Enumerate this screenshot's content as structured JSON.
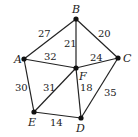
{
  "graph": {
    "nodes": [
      {
        "id": "A",
        "label": "A",
        "x": 24,
        "y": 59,
        "lx": 14,
        "ly": 63
      },
      {
        "id": "B",
        "label": "B",
        "x": 76,
        "y": 19,
        "lx": 72,
        "ly": 13
      },
      {
        "id": "C",
        "label": "C",
        "x": 118,
        "y": 58,
        "lx": 123,
        "ly": 62
      },
      {
        "id": "D",
        "label": "D",
        "x": 81,
        "y": 118,
        "lx": 76,
        "ly": 132
      },
      {
        "id": "E",
        "label": "E",
        "x": 34,
        "y": 112,
        "lx": 28,
        "ly": 126
      },
      {
        "id": "F",
        "label": "F",
        "x": 76,
        "y": 68,
        "lx": 79,
        "ly": 80
      }
    ],
    "edges": [
      {
        "from": "A",
        "to": "B",
        "weight": "27",
        "lx": 38,
        "ly": 37
      },
      {
        "from": "B",
        "to": "C",
        "weight": "20",
        "lx": 98,
        "ly": 37
      },
      {
        "from": "B",
        "to": "F",
        "weight": "21",
        "lx": 64,
        "ly": 47
      },
      {
        "from": "A",
        "to": "F",
        "weight": "32",
        "lx": 44,
        "ly": 60
      },
      {
        "from": "F",
        "to": "C",
        "weight": "24",
        "lx": 90,
        "ly": 61
      },
      {
        "from": "A",
        "to": "E",
        "weight": "30",
        "lx": 15,
        "ly": 91
      },
      {
        "from": "E",
        "to": "F",
        "weight": "31",
        "lx": 43,
        "ly": 91
      },
      {
        "from": "F",
        "to": "D",
        "weight": "18",
        "lx": 80,
        "ly": 91
      },
      {
        "from": "C",
        "to": "D",
        "weight": "35",
        "lx": 104,
        "ly": 96
      },
      {
        "from": "E",
        "to": "D",
        "weight": "14",
        "lx": 50,
        "ly": 126
      }
    ]
  }
}
